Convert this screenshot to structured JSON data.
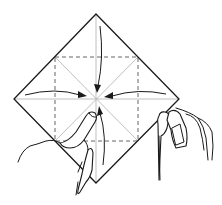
{
  "diagram": {
    "type": "origami-instruction",
    "colors": {
      "background": "#ffffff",
      "outline": "#1a1a1a",
      "crease": "#b8b8b8",
      "dashed_fold": "#555555"
    },
    "paper": {
      "shape": "diamond",
      "vertices": {
        "top": [
          96,
          14
        ],
        "right": [
          179,
          99
        ],
        "bottom": [
          96,
          183
        ],
        "left": [
          14,
          99
        ]
      },
      "center": [
        96,
        99
      ]
    },
    "dashed_square": {
      "x1": 55,
      "y1": 57,
      "x2": 138,
      "y2": 141
    },
    "arrows": [
      {
        "name": "top-arrow",
        "direction": "down-to-center"
      },
      {
        "name": "left-arrow",
        "direction": "right-to-center"
      },
      {
        "name": "right-arrow",
        "direction": "left-to-center"
      },
      {
        "name": "bottom-arrow",
        "direction": "up-to-center"
      }
    ],
    "hands": [
      {
        "name": "left-hand",
        "role": "thumb pressing toward center"
      },
      {
        "name": "right-hand",
        "role": "holding right corner"
      }
    ]
  }
}
